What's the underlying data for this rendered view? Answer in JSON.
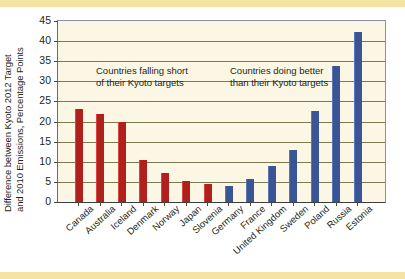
{
  "figure": {
    "ylabel_line1": "Difference between Kyoto 2012 Target",
    "ylabel_line2": "and 2010 Emissions, Percentage Points",
    "note_short_line1": "Countries falling short",
    "note_short_line2": "of their Kyoto targets",
    "note_better_line1": "Countries doing better",
    "note_better_line2": "than their Kyoto targets",
    "colors": {
      "bar_red": "#b0201d",
      "bar_blue": "#3a5596",
      "plot_background": "#fbf7e4",
      "gridline": "#7d7a52",
      "page_band": "#f5e3a3"
    }
  },
  "chart_data": {
    "type": "bar",
    "title": "",
    "xlabel": "",
    "ylabel": "Difference between Kyoto 2012 Target and 2010 Emissions, Percentage Points",
    "ylim": [
      0,
      45
    ],
    "yticks": [
      0,
      5,
      10,
      15,
      20,
      25,
      30,
      35,
      40,
      45
    ],
    "ytick_labels": [
      "0",
      "5",
      "10",
      "15",
      "20",
      "25",
      "30",
      "35",
      "40",
      "45"
    ],
    "grid": "horizontal",
    "legend": "none",
    "annotations": [
      "Countries falling short of their Kyoto targets",
      "Countries doing better than their Kyoto targets"
    ],
    "categories": [
      "Canada",
      "Australia",
      "Iceland",
      "Denmark",
      "Norway",
      "Japan",
      "Slovenia",
      "Germany",
      "France",
      "United Kingdom",
      "Sweden",
      "Poland",
      "Russia",
      "Estonia"
    ],
    "values": [
      23.1,
      21.9,
      19.8,
      10.5,
      7.2,
      5.3,
      4.5,
      4.0,
      5.8,
      9.0,
      12.9,
      22.6,
      33.8,
      42.2
    ],
    "bars": [
      {
        "label": "Canada",
        "value": 23.1,
        "group": "falling-short",
        "color": "#b0201d"
      },
      {
        "label": "Australia",
        "value": 21.9,
        "group": "falling-short",
        "color": "#b0201d"
      },
      {
        "label": "Iceland",
        "value": 19.8,
        "group": "falling-short",
        "color": "#b0201d"
      },
      {
        "label": "Denmark",
        "value": 10.5,
        "group": "falling-short",
        "color": "#b0201d"
      },
      {
        "label": "Norway",
        "value": 7.2,
        "group": "falling-short",
        "color": "#b0201d"
      },
      {
        "label": "Japan",
        "value": 5.3,
        "group": "falling-short",
        "color": "#b0201d"
      },
      {
        "label": "Slovenia",
        "value": 4.5,
        "group": "falling-short",
        "color": "#b0201d"
      },
      {
        "label": "Germany",
        "value": 4.0,
        "group": "doing-better",
        "color": "#3a5596"
      },
      {
        "label": "France",
        "value": 5.8,
        "group": "doing-better",
        "color": "#3a5596"
      },
      {
        "label": "United Kingdom",
        "value": 9.0,
        "group": "doing-better",
        "color": "#3a5596"
      },
      {
        "label": "Sweden",
        "value": 12.9,
        "group": "doing-better",
        "color": "#3a5596"
      },
      {
        "label": "Poland",
        "value": 22.6,
        "group": "doing-better",
        "color": "#3a5596"
      },
      {
        "label": "Russia",
        "value": 33.8,
        "group": "doing-better",
        "color": "#3a5596"
      },
      {
        "label": "Estonia",
        "value": 42.2,
        "group": "doing-better",
        "color": "#3a5596"
      }
    ]
  }
}
